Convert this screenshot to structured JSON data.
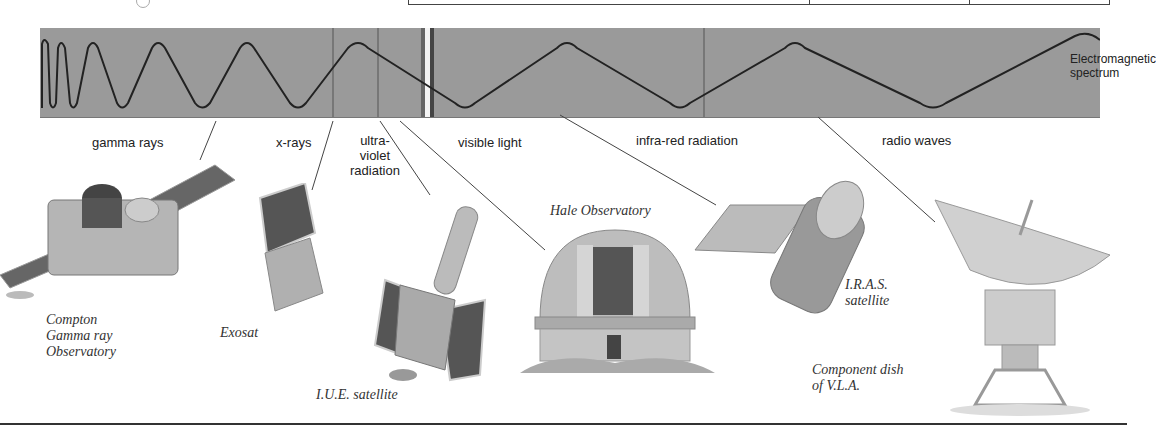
{
  "figure": {
    "band_title_line1": "Electromagnetic",
    "band_title_line2": "spectrum",
    "band_color": "#9a9a9a",
    "wave_color": "#222222"
  },
  "spectrum_regions": [
    {
      "label": "gamma rays"
    },
    {
      "label": "x-rays"
    },
    {
      "label_line1": "ultra-",
      "label_line2": "violet",
      "label_line3": "radiation"
    },
    {
      "label": "visible light"
    },
    {
      "label": "infra-red radiation"
    },
    {
      "label": "radio waves"
    }
  ],
  "instruments": [
    {
      "name_line1": "Compton",
      "name_line2": "Gamma ray",
      "name_line3": "Observatory",
      "icon": "gamma-ray-satellite-icon"
    },
    {
      "name": "Exosat",
      "icon": "x-ray-satellite-icon"
    },
    {
      "name": "I.U.E. satellite",
      "icon": "uv-satellite-icon"
    },
    {
      "name": "Hale Observatory",
      "icon": "observatory-dome-icon"
    },
    {
      "name_line1": "I.R.A.S.",
      "name_line2": "satellite",
      "icon": "infrared-satellite-icon"
    },
    {
      "name_line1": "Component dish",
      "name_line2": "of V.L.A.",
      "icon": "radio-dish-icon"
    }
  ]
}
